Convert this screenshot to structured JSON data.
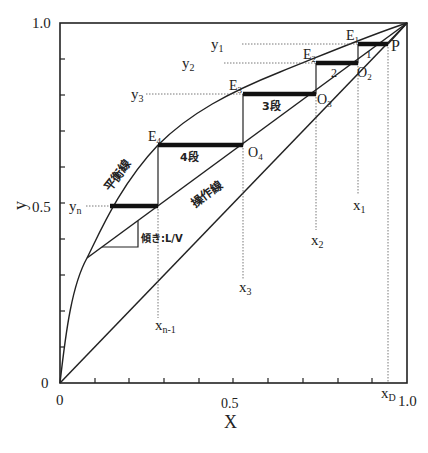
{
  "diagram": {
    "type": "McCabe-Thiele staircase diagram",
    "axes": {
      "x_label": "X",
      "y_label": "y",
      "x_ticks": [
        "0",
        "0.5",
        "1.0"
      ],
      "y_ticks": [
        "0",
        "0.5",
        "1.0"
      ]
    },
    "curves": {
      "equilibrium_label": "平衡線",
      "operating_label": "操作線",
      "slope_label": "傾き:L/V"
    },
    "stages": [
      {
        "label": "1",
        "E": "E1",
        "O": "P"
      },
      {
        "label": "2",
        "E": "E2",
        "O": "O2"
      },
      {
        "label": "3段",
        "E": "E3",
        "O": "O3"
      },
      {
        "label": "4段",
        "E": "E4",
        "O": "O4"
      }
    ],
    "point_labels": {
      "E1": "E",
      "E1_sub": "1",
      "E2": "E",
      "E2_sub": "2",
      "E3": "E",
      "E3_sub": "3",
      "E4": "E",
      "E4_sub": "4",
      "O2": "O",
      "O2_sub": "2",
      "O3": "O",
      "O3_sub": "3",
      "O4": "O",
      "O4_sub": "4",
      "P": "P"
    },
    "y_markers": [
      {
        "main": "y",
        "sub": "1"
      },
      {
        "main": "y",
        "sub": "2"
      },
      {
        "main": "y",
        "sub": "3"
      },
      {
        "main": "y",
        "sub": "n"
      }
    ],
    "x_markers": [
      {
        "main": "x",
        "sub": "1"
      },
      {
        "main": "x",
        "sub": "2"
      },
      {
        "main": "x",
        "sub": "3"
      },
      {
        "main": "x",
        "sub": "n-1"
      },
      {
        "main": "x",
        "sub": "D"
      }
    ]
  }
}
